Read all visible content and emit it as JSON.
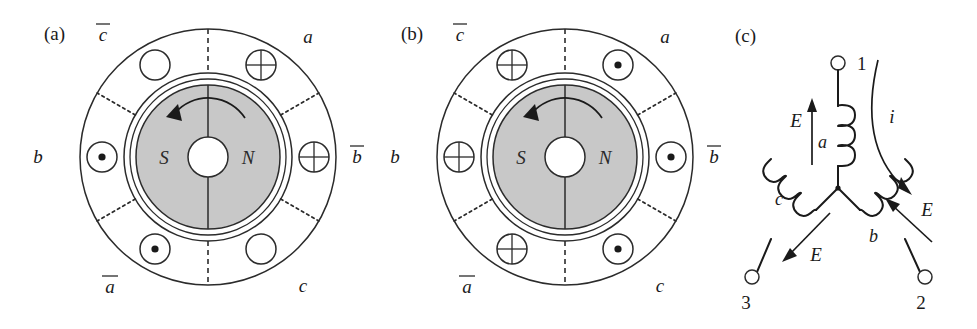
{
  "figure": {
    "background": "#ffffff",
    "accent": "#2b2b2b",
    "rotor_fill": "#c8c8c8"
  },
  "panels": [
    {
      "tag": "(a)",
      "tag_x": 44,
      "tag_y": 40,
      "center_x": 208,
      "center_y": 157,
      "stator_outer_r": 128,
      "stator_inner_r": 84,
      "rotor_outer_r": 78,
      "rotor_r": 72,
      "shaft_r": 20,
      "rotation_direction": "counterclockwise",
      "poles": [
        {
          "label": "S",
          "x": 164,
          "y": 164
        },
        {
          "label": "N",
          "x": 248,
          "y": 164
        }
      ],
      "phase_labels": [
        {
          "text": "c",
          "overbar": true,
          "x": 103,
          "y": 41,
          "name": "c-bar"
        },
        {
          "text": "a",
          "overbar": false,
          "x": 308,
          "y": 43,
          "name": "a"
        },
        {
          "text": "b",
          "overbar": false,
          "x": 38,
          "y": 163,
          "name": "b"
        },
        {
          "text": "b",
          "overbar": true,
          "x": 357,
          "y": 163,
          "name": "b-bar"
        },
        {
          "text": "a",
          "overbar": true,
          "x": 110,
          "y": 293,
          "name": "a-bar"
        },
        {
          "text": "c",
          "overbar": false,
          "x": 303,
          "y": 292,
          "name": "c"
        }
      ],
      "slots": [
        {
          "name": "slot-top-left",
          "marker": "empty",
          "angle": 120
        },
        {
          "name": "slot-top-right",
          "marker": "cross",
          "angle": 60
        },
        {
          "name": "slot-right",
          "marker": "cross",
          "angle": 0
        },
        {
          "name": "slot-bottom-right",
          "marker": "empty",
          "angle": -60
        },
        {
          "name": "slot-bottom-left",
          "marker": "dot",
          "angle": -120
        },
        {
          "name": "slot-left",
          "marker": "dot",
          "angle": 180
        }
      ]
    },
    {
      "tag": "(b)",
      "tag_x": 401,
      "tag_y": 40,
      "center_x": 565,
      "center_y": 157,
      "stator_outer_r": 128,
      "stator_inner_r": 84,
      "rotor_outer_r": 78,
      "rotor_r": 72,
      "shaft_r": 20,
      "rotation_direction": "counterclockwise",
      "poles": [
        {
          "label": "S",
          "x": 521,
          "y": 164
        },
        {
          "label": "N",
          "x": 605,
          "y": 164
        }
      ],
      "phase_labels": [
        {
          "text": "c",
          "overbar": true,
          "x": 460,
          "y": 41,
          "name": "c-bar"
        },
        {
          "text": "a",
          "overbar": false,
          "x": 665,
          "y": 43,
          "name": "a"
        },
        {
          "text": "b",
          "overbar": false,
          "x": 395,
          "y": 163,
          "name": "b"
        },
        {
          "text": "b",
          "overbar": true,
          "x": 714,
          "y": 163,
          "name": "b-bar"
        },
        {
          "text": "a",
          "overbar": true,
          "x": 467,
          "y": 293,
          "name": "a-bar"
        },
        {
          "text": "c",
          "overbar": false,
          "x": 660,
          "y": 292,
          "name": "c"
        }
      ],
      "slots": [
        {
          "name": "slot-top-left",
          "marker": "cross",
          "angle": 120
        },
        {
          "name": "slot-top-right",
          "marker": "dot",
          "angle": 60
        },
        {
          "name": "slot-right",
          "marker": "dot",
          "angle": 0
        },
        {
          "name": "slot-bottom-right",
          "marker": "dot",
          "angle": -60
        },
        {
          "name": "slot-bottom-left",
          "marker": "cross",
          "angle": -120
        },
        {
          "name": "slot-left",
          "marker": "cross",
          "angle": 180
        }
      ]
    }
  ],
  "circuit": {
    "tag": "(c)",
    "tag_x": 735,
    "tag_y": 42,
    "neutral_x": 838,
    "neutral_y": 188,
    "terminals": [
      {
        "label": "1",
        "name": "terminal-1",
        "cx": 838,
        "cy": 63,
        "label_x": 857,
        "label_y": 70
      },
      {
        "label": "2",
        "name": "terminal-2",
        "cx": 925,
        "cy": 277,
        "label_x": 921,
        "label_y": 309
      },
      {
        "label": "3",
        "name": "terminal-3",
        "cx": 752,
        "cy": 277,
        "label_x": 746,
        "label_y": 309
      }
    ],
    "coils": [
      {
        "name": "coil-a",
        "label": "a",
        "label_x": 818,
        "label_y": 148
      },
      {
        "name": "coil-b",
        "label": "b",
        "label_x": 869,
        "label_y": 242
      },
      {
        "name": "coil-c",
        "label": "c",
        "label_x": 775,
        "label_y": 205
      }
    ],
    "emf_arrows": [
      {
        "name": "emf-arrow-a",
        "label": "E",
        "label_x": 796,
        "label_y": 127,
        "direction": "up"
      },
      {
        "name": "emf-arrow-b",
        "label": "E",
        "label_x": 927,
        "label_y": 216,
        "direction": "up-left"
      },
      {
        "name": "emf-arrow-c",
        "label": "E",
        "label_x": 816,
        "label_y": 261,
        "direction": "down-left"
      }
    ],
    "current_arrow": {
      "name": "current-arrow",
      "label": "i",
      "label_x": 892,
      "label_y": 123,
      "direction": "clockwise-out"
    }
  }
}
